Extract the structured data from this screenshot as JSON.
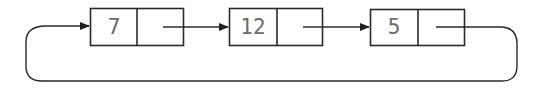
{
  "diagram": {
    "type": "circular-singly-linked-list",
    "nodes": [
      {
        "value": "7"
      },
      {
        "value": "12"
      },
      {
        "value": "5"
      }
    ],
    "links": [
      {
        "from": "7",
        "to": "12"
      },
      {
        "from": "12",
        "to": "5"
      },
      {
        "from": "5",
        "to": "7",
        "kind": "wrap-around"
      }
    ],
    "colors": {
      "stroke": "#2a2a2a",
      "text": "#6a6a6a",
      "background": "#ffffff"
    }
  }
}
